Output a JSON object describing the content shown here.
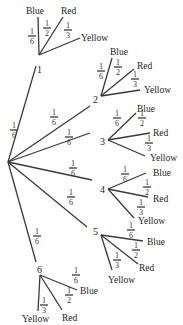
{
  "diagram": {
    "type": "probability-tree",
    "root": {
      "x": 8,
      "y": 162
    },
    "line_color": "#3a3a3a",
    "text_color": "#222222",
    "first_stage": [
      {
        "label": "1",
        "prob": "1/6",
        "pos": [
          10,
          79
        ],
        "label_pos": [
          11,
          94
        ],
        "prob_pos": [
          10,
          123
        ]
      },
      {
        "label": "2",
        "prob": "1/6",
        "pos": [
          88,
          146
        ],
        "label_pos": [
          92,
          155
        ],
        "prob_pos": [
          52,
          110
        ]
      },
      {
        "label": "3",
        "prob": "1/6",
        "pos": [
          92,
          138
        ],
        "label_pos": [
          96,
          143
        ],
        "prob_pos": [
          68,
          143
        ]
      },
      {
        "label": "4",
        "prob": "1/6",
        "pos": [
          95,
          189
        ],
        "label_pos": [
          98,
          192
        ],
        "prob_pos": [
          72,
          176
        ]
      },
      {
        "label": "5",
        "prob": "1/6",
        "pos": [
          92,
          228
        ],
        "label_pos": [
          95,
          232
        ],
        "prob_pos": [
          70,
          200
        ]
      },
      {
        "label": "6",
        "prob": "1/6",
        "pos": [
          40,
          269
        ],
        "label_pos": [
          38,
          273
        ],
        "prob_pos": [
          38,
          240
        ]
      }
    ],
    "outcomes": [
      "Blue",
      "Red",
      "Yellow"
    ],
    "outcome_probs": {
      "Blue": "1/6",
      "Red": "1/2",
      "Yellow": "1/3"
    },
    "nodes": {
      "n1": {
        "label": "1",
        "children": [
          {
            "label": "Blue",
            "prob": "1/6"
          },
          {
            "label": "Red",
            "prob": "1/2"
          },
          {
            "label": "Yellow",
            "prob": "1/3"
          }
        ]
      },
      "n2": {
        "label": "2",
        "children": [
          {
            "label": "Blue",
            "prob": "1/6"
          },
          {
            "label": "Red",
            "prob": "1/2"
          },
          {
            "label": "Yellow",
            "prob": "1/3"
          }
        ]
      },
      "n3": {
        "label": "3",
        "children": [
          {
            "label": "Blue",
            "prob": "1/6"
          },
          {
            "label": "Red",
            "prob": "1/2"
          },
          {
            "label": "Yellow",
            "prob": "1/3"
          }
        ]
      },
      "n4": {
        "label": "4",
        "children": [
          {
            "label": "Blue",
            "prob": "1/6"
          },
          {
            "label": "Red",
            "prob": "1/2"
          },
          {
            "label": "Yellow",
            "prob": "1/3"
          }
        ]
      },
      "n5": {
        "label": "5",
        "children": [
          {
            "label": "Blue",
            "prob": "1/6"
          },
          {
            "label": "Red",
            "prob": "1/2"
          },
          {
            "label": "Yellow",
            "prob": "1/3"
          }
        ]
      },
      "n6": {
        "label": "6",
        "children": [
          {
            "label": "Blue",
            "prob": "1/6"
          },
          {
            "label": "Red",
            "prob": "1/2"
          },
          {
            "label": "Yellow",
            "prob": "1/3"
          }
        ]
      }
    },
    "fraction_one_sixth": {
      "num": "1",
      "den": "6"
    },
    "fraction_one_half": {
      "num": "1",
      "den": "2"
    },
    "fraction_one_third": {
      "num": "1",
      "den": "3"
    }
  }
}
